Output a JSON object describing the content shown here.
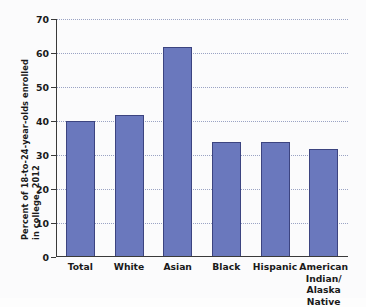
{
  "chart_data": {
    "type": "bar",
    "title": "",
    "xlabel": "",
    "ylabel_line1": "Percent of 18-to-24-year-olds enrolled",
    "ylabel_line2": "in college, 2012",
    "categories": [
      "Total",
      "White",
      "Asian",
      "Black",
      "Hispanic",
      "American Indian/ Alaska Native"
    ],
    "category_lines": [
      [
        "Total"
      ],
      [
        "White"
      ],
      [
        "Asian"
      ],
      [
        "Black"
      ],
      [
        "Hispanic"
      ],
      [
        "American",
        "Indian/",
        "Alaska Native"
      ]
    ],
    "values": [
      40.0,
      41.9,
      61.8,
      33.8,
      33.7,
      31.7
    ],
    "ylim": [
      0,
      70
    ],
    "yticks": [
      0,
      10,
      20,
      30,
      40,
      50,
      60,
      70
    ],
    "ytick_labels": [
      "0",
      "10",
      "20",
      "30",
      "40",
      "50",
      "60",
      "70"
    ],
    "grid": true,
    "grid_axis": "y",
    "legend": "none",
    "bar_color": "#6a78bd",
    "bar_border_color": "#3c4480",
    "gridline_color": "#9aa3c4",
    "axis_color": "#3a3a3a",
    "background_color": "#fbfbfc"
  }
}
